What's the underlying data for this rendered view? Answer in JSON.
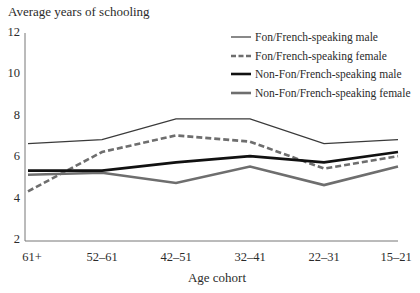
{
  "chart_data": {
    "type": "line",
    "title": "",
    "ylabel": "Average years of schooling",
    "xlabel": "Age cohort",
    "categories": [
      "61+",
      "52–61",
      "42–51",
      "32–41",
      "22–31",
      "15–21"
    ],
    "ylim": [
      2,
      12
    ],
    "yticks": [
      "2",
      "4",
      "6",
      "8",
      "10",
      "12"
    ],
    "grid": false,
    "legend_position": "upper right",
    "series": [
      {
        "name": "Fon/French-speaking male",
        "style": "thin solid",
        "color": "#3a3a3a",
        "values": [
          6.7,
          6.9,
          7.9,
          7.9,
          6.7,
          6.9
        ]
      },
      {
        "name": "Fon/French-speaking female",
        "style": "dashed",
        "color": "#6e6e6e",
        "values": [
          4.4,
          6.3,
          7.1,
          6.8,
          5.5,
          6.1
        ]
      },
      {
        "name": "Non-Fon/French-speaking male",
        "style": "thick solid",
        "color": "#111111",
        "values": [
          5.4,
          5.4,
          5.8,
          6.1,
          5.8,
          6.3
        ]
      },
      {
        "name": "Non-Fon/French-speaking female",
        "style": "thick solid gray",
        "color": "#6e6e6e",
        "values": [
          5.2,
          5.3,
          4.8,
          5.6,
          4.7,
          5.6
        ]
      }
    ]
  },
  "labels": {
    "y_axis_title": "Average years of schooling",
    "x_axis_title": "Age cohort"
  }
}
